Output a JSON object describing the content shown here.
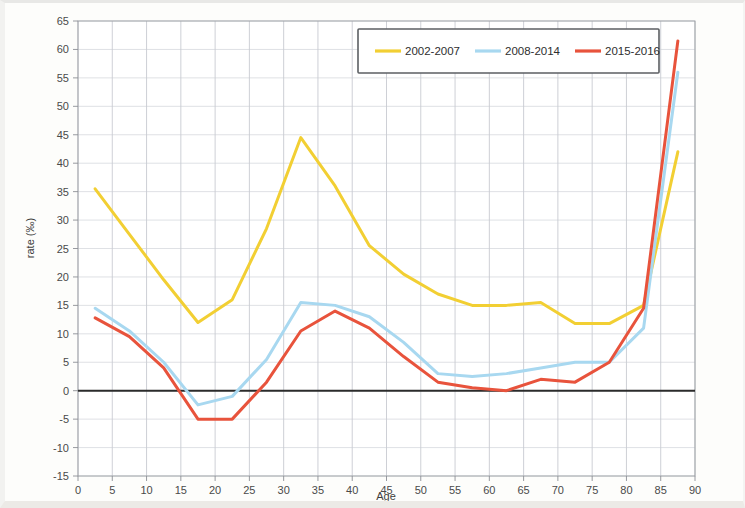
{
  "chart_data": {
    "type": "line",
    "title": "",
    "xlabel": "Age",
    "ylabel": "rate (‰)",
    "xlim": [
      0,
      90
    ],
    "ylim": [
      -15,
      65
    ],
    "xticks": [
      0,
      5,
      10,
      15,
      20,
      25,
      30,
      35,
      40,
      45,
      50,
      55,
      60,
      65,
      70,
      75,
      80,
      85,
      90
    ],
    "yticks": [
      -15,
      -10,
      -5,
      0,
      5,
      10,
      15,
      20,
      25,
      30,
      35,
      40,
      45,
      50,
      55,
      60,
      65
    ],
    "grid": true,
    "zero_reference_line": 0,
    "legend_position": "top-center",
    "x": [
      2.5,
      7.5,
      12.5,
      17.5,
      22.5,
      27.5,
      32.5,
      37.5,
      42.5,
      47.5,
      52.5,
      57.5,
      62.5,
      67.5,
      72.5,
      77.5,
      82.5,
      87.5
    ],
    "series": [
      {
        "name": "2002-2007",
        "color": "#f2cf33",
        "values": [
          35.5,
          27.5,
          19.5,
          12.0,
          16.0,
          28.5,
          44.5,
          36.0,
          25.5,
          20.5,
          17.0,
          15.0,
          15.0,
          15.5,
          11.8,
          11.8,
          15.0,
          42.0
        ]
      },
      {
        "name": "2008-2014",
        "color": "#a8d8f0",
        "values": [
          14.5,
          10.5,
          5.0,
          -2.5,
          -1.0,
          5.5,
          15.5,
          15.0,
          13.0,
          8.5,
          3.0,
          2.5,
          3.0,
          4.0,
          5.0,
          5.0,
          11.0,
          56.0
        ]
      },
      {
        "name": "2015-2016",
        "color": "#e8533c",
        "values": [
          12.8,
          9.5,
          4.0,
          -5.0,
          -5.0,
          1.5,
          10.5,
          14.0,
          11.0,
          6.0,
          1.5,
          0.5,
          0.0,
          2.0,
          1.5,
          5.0,
          14.5,
          61.5
        ]
      }
    ]
  },
  "legend": {
    "entries": [
      {
        "label": "2002-2007"
      },
      {
        "label": "2008-2014"
      },
      {
        "label": "2015-2016"
      }
    ]
  },
  "axes": {
    "x_title": "Age",
    "y_title": "rate (‰)",
    "x_tick_labels": [
      "0",
      "5",
      "10",
      "15",
      "20",
      "25",
      "30",
      "35",
      "40",
      "45",
      "50",
      "55",
      "60",
      "65",
      "70",
      "75",
      "80",
      "85",
      "90"
    ],
    "y_tick_labels": [
      "65",
      "60",
      "55",
      "50",
      "45",
      "40",
      "35",
      "30",
      "25",
      "20",
      "15",
      "10",
      "5",
      "0",
      "-5",
      "-10",
      "-15"
    ]
  }
}
